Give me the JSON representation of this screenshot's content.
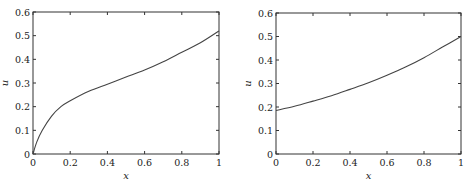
{
  "chart_data": [
    {
      "type": "line",
      "title": "",
      "xlabel": "x",
      "ylabel": "u",
      "xlim": [
        0,
        1
      ],
      "ylim": [
        0,
        0.6
      ],
      "grid": false,
      "legend": null,
      "xticks": [
        "0",
        "0.2",
        "0.4",
        "0.6",
        "0.8",
        "1"
      ],
      "yticks": [
        "0",
        "0.1",
        "0.2",
        "0.3",
        "0.4",
        "0.5",
        "0.6"
      ],
      "series": [
        {
          "name": "u(x)",
          "color": "#444444",
          "x": [
            0,
            0.02,
            0.05,
            0.1,
            0.15,
            0.2,
            0.3,
            0.4,
            0.5,
            0.6,
            0.7,
            0.8,
            0.9,
            1.0
          ],
          "y": [
            0,
            0.05,
            0.1,
            0.16,
            0.2,
            0.225,
            0.265,
            0.295,
            0.325,
            0.355,
            0.39,
            0.43,
            0.47,
            0.52
          ]
        }
      ],
      "frame": {
        "left": 33,
        "right": 219,
        "top": 12,
        "bottom": 154
      }
    },
    {
      "type": "line",
      "title": "",
      "xlabel": "x",
      "ylabel": "u",
      "xlim": [
        0,
        1
      ],
      "ylim": [
        0,
        0.6
      ],
      "grid": false,
      "legend": null,
      "xticks": [
        "0",
        "0.2",
        "0.4",
        "0.6",
        "0.8",
        "1"
      ],
      "yticks": [
        "0",
        "0.1",
        "0.2",
        "0.3",
        "0.4",
        "0.5",
        "0.6"
      ],
      "series": [
        {
          "name": "u(x)",
          "color": "#444444",
          "x": [
            0,
            0.1,
            0.2,
            0.3,
            0.4,
            0.5,
            0.6,
            0.7,
            0.8,
            0.9,
            1.0
          ],
          "y": [
            0.185,
            0.203,
            0.225,
            0.248,
            0.275,
            0.303,
            0.335,
            0.37,
            0.41,
            0.455,
            0.5
          ]
        }
      ],
      "frame": {
        "left": 276,
        "right": 461,
        "top": 13,
        "bottom": 154
      }
    }
  ]
}
